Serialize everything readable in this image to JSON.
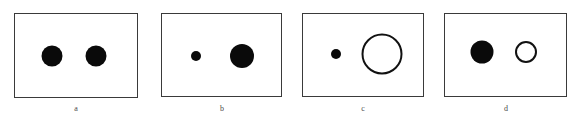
{
  "figure": {
    "type": "multi-panel-stimulus-diagram",
    "width": 579,
    "height": 124,
    "background_color": "#ffffff",
    "box_stroke_color": "#3a3a3a",
    "filled_circle_color": "#0a0a0a",
    "open_circle_stroke_color": "#111111",
    "label_color": "#4a4a4a",
    "panels": [
      {
        "id": "a",
        "label": "a",
        "box": {
          "x": 14,
          "y": 13,
          "width": 124,
          "height": 85
        },
        "label_x": 76,
        "label_y": 104,
        "circles": [
          {
            "name": "left-circle",
            "fill": "filled",
            "cx": 52,
            "cy": 56,
            "diameter": 21
          },
          {
            "name": "right-circle",
            "fill": "filled",
            "cx": 96,
            "cy": 56,
            "diameter": 21
          }
        ]
      },
      {
        "id": "b",
        "label": "b",
        "box": {
          "x": 161,
          "y": 13,
          "width": 121,
          "height": 84
        },
        "label_x": 222,
        "label_y": 104,
        "circles": [
          {
            "name": "left-circle",
            "fill": "filled",
            "cx": 196,
            "cy": 56,
            "diameter": 10
          },
          {
            "name": "right-circle",
            "fill": "filled",
            "cx": 242,
            "cy": 56,
            "diameter": 24
          }
        ]
      },
      {
        "id": "c",
        "label": "c",
        "box": {
          "x": 302,
          "y": 13,
          "width": 122,
          "height": 84
        },
        "label_x": 363,
        "label_y": 104,
        "circles": [
          {
            "name": "left-circle",
            "fill": "filled",
            "cx": 336,
            "cy": 54,
            "diameter": 10
          },
          {
            "name": "right-circle",
            "fill": "open",
            "cx": 382,
            "cy": 54,
            "diameter": 41
          }
        ]
      },
      {
        "id": "d",
        "label": "d",
        "box": {
          "x": 444,
          "y": 13,
          "width": 123,
          "height": 84
        },
        "label_x": 506,
        "label_y": 104,
        "circles": [
          {
            "name": "left-circle",
            "fill": "filled",
            "cx": 482,
            "cy": 52,
            "diameter": 23
          },
          {
            "name": "right-circle",
            "fill": "open",
            "cx": 526,
            "cy": 52,
            "diameter": 22
          }
        ]
      }
    ]
  }
}
